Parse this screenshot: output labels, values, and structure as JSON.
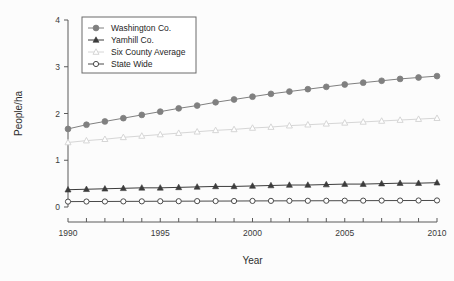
{
  "chart_data": {
    "type": "line",
    "title": "",
    "xlabel": "Year",
    "ylabel": "People/ha",
    "xlim": [
      1990,
      2010
    ],
    "ylim": [
      0,
      4
    ],
    "yticks": [
      0,
      1,
      2,
      3,
      4
    ],
    "xticks": [
      1990,
      1995,
      2000,
      2005,
      2010
    ],
    "xticks_minor_step": 1,
    "grid": false,
    "legend_position": "top-left-inside",
    "x": [
      1990,
      1991,
      1992,
      1993,
      1994,
      1995,
      1996,
      1997,
      1998,
      1999,
      2000,
      2001,
      2002,
      2003,
      2004,
      2005,
      2006,
      2007,
      2008,
      2009,
      2010
    ],
    "series": [
      {
        "name": "Washington Co.",
        "marker": "filled-circle",
        "color": "#808080",
        "values": [
          1.67,
          1.76,
          1.83,
          1.9,
          1.97,
          2.04,
          2.11,
          2.17,
          2.24,
          2.3,
          2.36,
          2.42,
          2.47,
          2.52,
          2.57,
          2.62,
          2.66,
          2.7,
          2.74,
          2.77,
          2.8
        ]
      },
      {
        "name": "Yamhill Co.",
        "marker": "filled-triangle",
        "color": "#3c3c3c",
        "values": [
          0.37,
          0.38,
          0.39,
          0.4,
          0.41,
          0.41,
          0.42,
          0.43,
          0.44,
          0.44,
          0.45,
          0.46,
          0.47,
          0.47,
          0.48,
          0.49,
          0.49,
          0.5,
          0.51,
          0.51,
          0.52
        ]
      },
      {
        "name": "Six County Average",
        "marker": "open-triangle",
        "color": "#d6d6d6",
        "values": [
          1.38,
          1.42,
          1.45,
          1.49,
          1.52,
          1.55,
          1.58,
          1.61,
          1.64,
          1.66,
          1.69,
          1.71,
          1.74,
          1.76,
          1.78,
          1.8,
          1.82,
          1.84,
          1.86,
          1.88,
          1.9
        ]
      },
      {
        "name": "State Wide",
        "marker": "open-circle",
        "color": "#4a4a4a",
        "values": [
          0.115,
          0.117,
          0.118,
          0.12,
          0.121,
          0.123,
          0.124,
          0.126,
          0.127,
          0.128,
          0.13,
          0.131,
          0.132,
          0.133,
          0.134,
          0.135,
          0.136,
          0.137,
          0.138,
          0.139,
          0.14
        ]
      }
    ]
  },
  "legend": {
    "entries": [
      {
        "label": "Washington Co."
      },
      {
        "label": "Yamhill Co."
      },
      {
        "label": "Six County Average"
      },
      {
        "label": "State Wide"
      }
    ]
  },
  "axes": {
    "y_title": "People/ha",
    "x_title": "Year",
    "y_tick_labels": [
      "0",
      "1",
      "2",
      "3",
      "4"
    ],
    "x_tick_labels": [
      "1990",
      "1995",
      "2000",
      "2005",
      "2010"
    ]
  }
}
